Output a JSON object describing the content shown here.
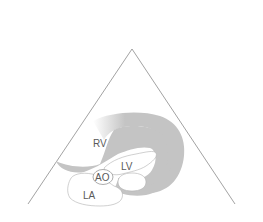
{
  "diagram": {
    "view": "parasternal long axis echocardiography",
    "labels": {
      "rv": "RV",
      "lv": "LV",
      "ao": "AO",
      "la": "LA"
    },
    "colors": {
      "background": "#ffffff",
      "sector_line": "#8a8a8a",
      "myocardium": "#c4c4c4",
      "chamber": "#ffffff",
      "chamber_outline": "#b0b0b0",
      "label_text": "#5a5a5a"
    }
  }
}
